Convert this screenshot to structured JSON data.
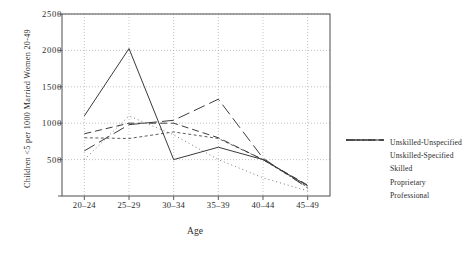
{
  "chart_data": {
    "type": "line",
    "title": "",
    "xlabel": "Age",
    "ylabel": "Children <5 per 1000 Married Women 20-49",
    "categories": [
      "20–24",
      "25–29",
      "30–34",
      "35–39",
      "40–44",
      "45–49"
    ],
    "yticks": [
      0,
      500,
      1000,
      1500,
      2000,
      2500
    ],
    "ytick_labels": [
      "0",
      "500",
      "1000",
      "1500",
      "2000",
      "2500"
    ],
    "ylim": [
      0,
      2500
    ],
    "grid": true,
    "legend_position": "right",
    "series": [
      {
        "name": "Unskilled-Unspecified",
        "style": "dotted",
        "dash": "1,3",
        "width": 0.9,
        "color": "#6b6b6b",
        "values": [
          500,
          1100,
          840,
          500,
          250,
          70
        ]
      },
      {
        "name": "Unskilled-Specified",
        "style": "fine-dash",
        "dash": "3,2.5",
        "width": 0.9,
        "color": "#4a4a4a",
        "values": [
          800,
          790,
          880,
          790,
          500,
          120
        ]
      },
      {
        "name": "Skilled",
        "style": "dashed",
        "dash": "7,4",
        "width": 1.0,
        "color": "#3d3d3d",
        "values": [
          855,
          1000,
          1000,
          800,
          500,
          150
        ]
      },
      {
        "name": "Proprietary",
        "style": "long-dash",
        "dash": "12,5",
        "width": 1.0,
        "color": "#3d3d3d",
        "values": [
          620,
          980,
          1040,
          1330,
          520,
          110
        ]
      },
      {
        "name": "Professional",
        "style": "solid",
        "dash": "none",
        "width": 1.0,
        "color": "#3a3a3a",
        "values": [
          1100,
          2025,
          500,
          670,
          500,
          140
        ]
      }
    ]
  },
  "axes": {
    "xlabel": "Age",
    "ylabel": "Children <5 per 1000 Married Women 20-49"
  }
}
